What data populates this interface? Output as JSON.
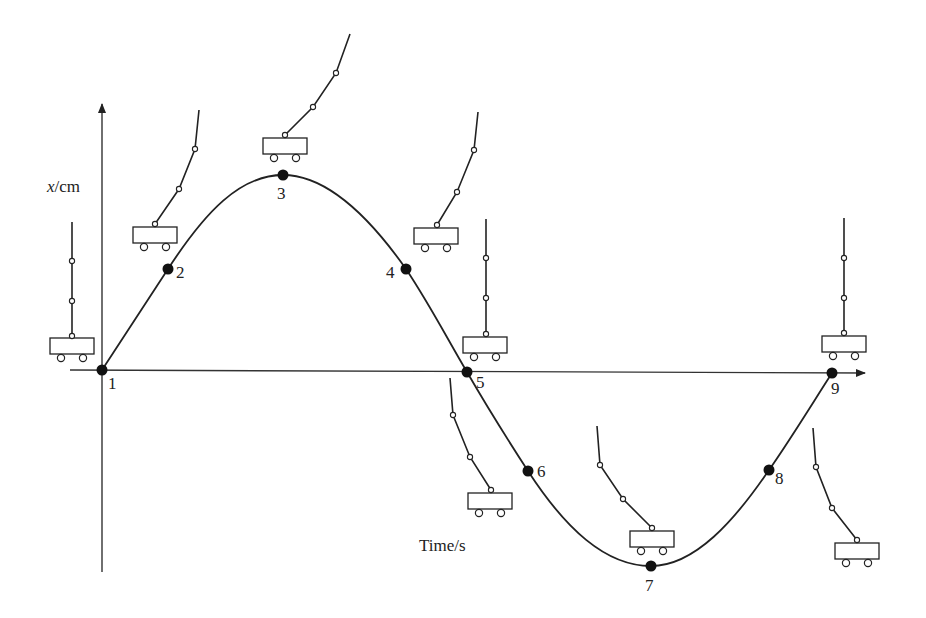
{
  "axes": {
    "y_label_var": "x",
    "y_label_unit": "/cm",
    "x_label": "Time/s"
  },
  "points": [
    {
      "label": "1",
      "x": 102,
      "y": 370,
      "lx": 108,
      "ly": 389
    },
    {
      "label": "2",
      "x": 168,
      "y": 269,
      "lx": 176,
      "ly": 278
    },
    {
      "label": "3",
      "x": 283,
      "y": 175,
      "lx": 277,
      "ly": 199
    },
    {
      "label": "4",
      "x": 406,
      "y": 269,
      "lx": 386,
      "ly": 278
    },
    {
      "label": "5",
      "x": 467,
      "y": 372,
      "lx": 476,
      "ly": 388
    },
    {
      "label": "6",
      "x": 528,
      "y": 471,
      "lx": 537,
      "ly": 477
    },
    {
      "label": "7",
      "x": 651,
      "y": 566,
      "lx": 645,
      "ly": 591
    },
    {
      "label": "8",
      "x": 769,
      "y": 470,
      "lx": 775,
      "ly": 484
    },
    {
      "label": "9",
      "x": 832,
      "y": 373,
      "lx": 831,
      "ly": 394
    }
  ],
  "carts": [
    {
      "name": "cart-1",
      "box": [
        50,
        338
      ],
      "rod": [
        [
          72,
          336
        ],
        [
          72,
          301
        ],
        [
          72,
          261
        ],
        [
          72,
          222
        ]
      ]
    },
    {
      "name": "cart-2",
      "box": [
        133,
        227
      ],
      "rod": [
        [
          155,
          224
        ],
        [
          179,
          189
        ],
        [
          195,
          149
        ],
        [
          199,
          110
        ]
      ]
    },
    {
      "name": "cart-3",
      "box": [
        263,
        138
      ],
      "rod": [
        [
          285,
          135
        ],
        [
          313,
          107
        ],
        [
          336,
          73
        ],
        [
          350,
          34
        ]
      ]
    },
    {
      "name": "cart-4",
      "box": [
        414,
        228
      ],
      "rod": [
        [
          437,
          225
        ],
        [
          457,
          192
        ],
        [
          474,
          150
        ],
        [
          478,
          112
        ]
      ]
    },
    {
      "name": "cart-5",
      "box": [
        463,
        337
      ],
      "rod": [
        [
          486,
          334
        ],
        [
          486,
          298
        ],
        [
          486,
          258
        ],
        [
          486,
          219
        ]
      ]
    },
    {
      "name": "cart-6",
      "box": [
        468,
        493
      ],
      "rod": [
        [
          491,
          490
        ],
        [
          470,
          457
        ],
        [
          453,
          415
        ],
        [
          450,
          378
        ]
      ]
    },
    {
      "name": "cart-7",
      "box": [
        630,
        531
      ],
      "rod": [
        [
          652,
          528
        ],
        [
          623,
          499
        ],
        [
          600,
          465
        ],
        [
          597,
          426
        ]
      ]
    },
    {
      "name": "cart-9",
      "box": [
        822,
        336
      ],
      "rod": [
        [
          844,
          333
        ],
        [
          844,
          298
        ],
        [
          844,
          258
        ],
        [
          844,
          218
        ]
      ]
    },
    {
      "name": "cart-10",
      "box": [
        835,
        543
      ],
      "rod": [
        [
          857,
          540
        ],
        [
          832,
          508
        ],
        [
          816,
          467
        ],
        [
          813,
          428
        ]
      ]
    }
  ],
  "chart_data": {
    "type": "line",
    "title": "",
    "xlabel": "Time/s",
    "ylabel": "x/cm",
    "x": [
      1,
      2,
      3,
      4,
      5,
      6,
      7,
      8,
      9
    ],
    "point_labels": [
      "1",
      "2",
      "3",
      "4",
      "5",
      "6",
      "7",
      "8",
      "9"
    ],
    "values": [
      0,
      0.5,
      1,
      0.5,
      0,
      -0.5,
      -1,
      -0.5,
      0
    ],
    "grid": false,
    "legend": null
  }
}
